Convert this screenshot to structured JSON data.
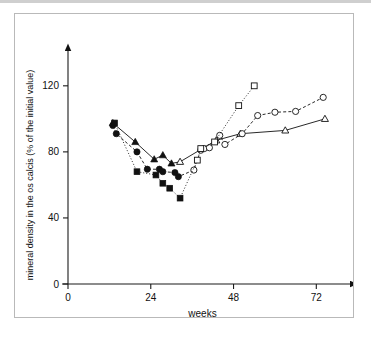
{
  "figure": {
    "caption_present": false,
    "frame_color": "#b9b9b9",
    "background": "#ffffff"
  },
  "chart_data": {
    "type": "scatter",
    "title": "",
    "subtitle": "",
    "xlabel": "weeks",
    "ylabel": "mineral density in the os calcis (% of the initial value)",
    "xlim": [
      0,
      78
    ],
    "ylim": [
      0,
      132
    ],
    "xticks": [
      0,
      24,
      48,
      72
    ],
    "xticklabels": [
      "0",
      "24",
      "48",
      "72"
    ],
    "yticks": [
      0,
      40,
      80,
      120
    ],
    "yticklabels": [
      "0",
      "40",
      "80",
      "120"
    ],
    "grid": false,
    "legend": "none",
    "axis_style": "arrowed-open-axes",
    "marker_color": "#111111",
    "series": [
      {
        "name": "triangle-series",
        "marker": "triangle",
        "fill_early": "filled",
        "fill_late": "open",
        "line": "solid",
        "points": [
          {
            "x": 13.0,
            "y": 97.5,
            "fill": "filled"
          },
          {
            "x": 19.5,
            "y": 86.0,
            "fill": "filled"
          },
          {
            "x": 25.0,
            "y": 75.5,
            "fill": "filled"
          },
          {
            "x": 27.5,
            "y": 78.0,
            "fill": "filled"
          },
          {
            "x": 30.0,
            "y": 73.0,
            "fill": "filled"
          },
          {
            "x": 32.5,
            "y": 74.0,
            "fill": "open"
          },
          {
            "x": 43.0,
            "y": 87.0,
            "fill": "open"
          },
          {
            "x": 50.0,
            "y": 91.0,
            "fill": "open"
          },
          {
            "x": 63.0,
            "y": 93.0,
            "fill": "open"
          },
          {
            "x": 74.5,
            "y": 100.0,
            "fill": "open"
          }
        ]
      },
      {
        "name": "circle-series",
        "marker": "circle",
        "fill_early": "filled",
        "fill_late": "open",
        "line": "dashed",
        "points": [
          {
            "x": 13.0,
            "y": 96.0,
            "fill": "filled"
          },
          {
            "x": 14.0,
            "y": 91.0,
            "fill": "filled"
          },
          {
            "x": 20.0,
            "y": 80.0,
            "fill": "filled"
          },
          {
            "x": 23.0,
            "y": 69.5,
            "fill": "filled"
          },
          {
            "x": 26.5,
            "y": 69.5,
            "fill": "filled"
          },
          {
            "x": 27.5,
            "y": 68.0,
            "fill": "filled"
          },
          {
            "x": 31.0,
            "y": 67.5,
            "fill": "filled"
          },
          {
            "x": 32.0,
            "y": 65.0,
            "fill": "filled"
          },
          {
            "x": 36.5,
            "y": 69.0,
            "fill": "open"
          },
          {
            "x": 38.5,
            "y": 81.0,
            "fill": "open"
          },
          {
            "x": 39.5,
            "y": 82.0,
            "fill": "open"
          },
          {
            "x": 41.0,
            "y": 82.5,
            "fill": "open"
          },
          {
            "x": 44.0,
            "y": 90.0,
            "fill": "open"
          },
          {
            "x": 45.5,
            "y": 84.5,
            "fill": "open"
          },
          {
            "x": 50.5,
            "y": 91.0,
            "fill": "open"
          },
          {
            "x": 55.0,
            "y": 102.0,
            "fill": "open"
          },
          {
            "x": 60.0,
            "y": 104.0,
            "fill": "open"
          },
          {
            "x": 66.0,
            "y": 104.5,
            "fill": "open"
          },
          {
            "x": 74.0,
            "y": 113.0,
            "fill": "open"
          }
        ]
      },
      {
        "name": "square-series",
        "marker": "square",
        "fill_early": "filled",
        "fill_late": "open",
        "line": "dotted",
        "points": [
          {
            "x": 13.5,
            "y": 97.5,
            "fill": "filled"
          },
          {
            "x": 20.0,
            "y": 68.0,
            "fill": "filled"
          },
          {
            "x": 25.5,
            "y": 66.0,
            "fill": "filled"
          },
          {
            "x": 27.5,
            "y": 61.0,
            "fill": "filled"
          },
          {
            "x": 29.5,
            "y": 58.0,
            "fill": "filled"
          },
          {
            "x": 32.5,
            "y": 52.0,
            "fill": "filled"
          },
          {
            "x": 37.5,
            "y": 75.0,
            "fill": "open"
          },
          {
            "x": 38.5,
            "y": 82.0,
            "fill": "open"
          },
          {
            "x": 42.5,
            "y": 86.0,
            "fill": "open"
          },
          {
            "x": 49.5,
            "y": 108.0,
            "fill": "open"
          },
          {
            "x": 54.0,
            "y": 120.0,
            "fill": "open"
          }
        ]
      }
    ]
  }
}
